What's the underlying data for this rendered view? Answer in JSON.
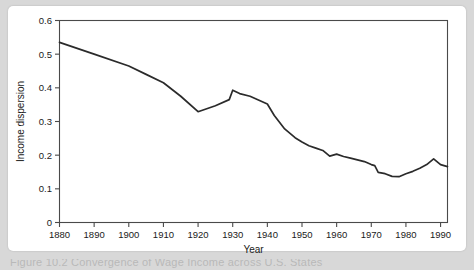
{
  "figure": {
    "caption_fragment": "Figure 10.2  Convergence of Wage Income across U.S. States",
    "background_color": "#d8d8d8",
    "card_color": "#ffffff",
    "line_color": "#2b2b2b",
    "axis_color": "#4a4a4a"
  },
  "chart_data": {
    "type": "line",
    "title": "",
    "xlabel": "Year",
    "ylabel": "Income dispersion",
    "xlim": [
      1880,
      1992
    ],
    "ylim": [
      0,
      0.6
    ],
    "xticks": [
      1880,
      1890,
      1900,
      1910,
      1920,
      1930,
      1940,
      1950,
      1960,
      1970,
      1980,
      1990
    ],
    "xticklabels": [
      "1880",
      "1890",
      "1900",
      "1910",
      "1920",
      "1930",
      "1940",
      "1950",
      "1960",
      "1970",
      "1980",
      "1990"
    ],
    "yticks": [
      0,
      0.1,
      0.2,
      0.3,
      0.4,
      0.5,
      0.6
    ],
    "yticklabels": [
      "0",
      "0.1",
      "0.2",
      "0.3",
      "0.4",
      "0.5",
      "0.6"
    ],
    "grid": false,
    "legend": "none",
    "series": [
      {
        "name": "Income dispersion",
        "x": [
          1880,
          1890,
          1900,
          1905,
          1910,
          1915,
          1920,
          1925,
          1929,
          1930,
          1932,
          1935,
          1940,
          1942,
          1945,
          1948,
          1950,
          1952,
          1954,
          1956,
          1958,
          1960,
          1962,
          1964,
          1966,
          1968,
          1970,
          1971,
          1972,
          1974,
          1976,
          1978,
          1980,
          1982,
          1984,
          1986,
          1988,
          1990,
          1992
        ],
        "values": [
          0.535,
          0.5,
          0.465,
          0.44,
          0.415,
          0.375,
          0.329,
          0.347,
          0.365,
          0.393,
          0.383,
          0.375,
          0.352,
          0.318,
          0.278,
          0.252,
          0.239,
          0.228,
          0.221,
          0.214,
          0.197,
          0.203,
          0.196,
          0.191,
          0.186,
          0.181,
          0.172,
          0.169,
          0.149,
          0.145,
          0.137,
          0.136,
          0.145,
          0.152,
          0.161,
          0.172,
          0.189,
          0.172,
          0.166
        ]
      }
    ]
  }
}
